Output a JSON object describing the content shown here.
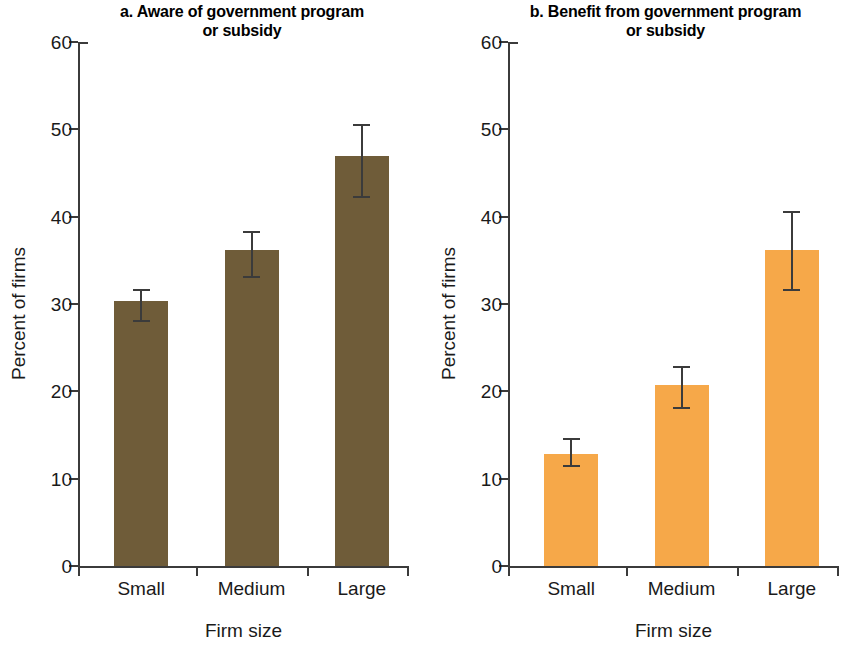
{
  "chart_data": [
    {
      "type": "bar",
      "panel_letter": "a.",
      "title": "a. Aware of government program or subsidy",
      "title_line1": "a. Aware of government program",
      "title_line2": "or subsidy",
      "categories": [
        "Small",
        "Medium",
        "Large"
      ],
      "values": [
        30.3,
        36.2,
        47.0
      ],
      "errors_low": [
        28.0,
        33.1,
        42.2
      ],
      "errors_high": [
        31.6,
        38.3,
        50.5
      ],
      "xlabel": "Firm size",
      "ylabel": "Percent of firms",
      "ylim": [
        0,
        60
      ],
      "yticks": [
        0,
        10,
        20,
        30,
        40,
        50,
        60
      ],
      "ytick_labels": [
        "0",
        "10",
        "20",
        "30",
        "40",
        "50",
        "60"
      ],
      "grid": false,
      "legend": "none",
      "bar_color": "#6f5c39"
    },
    {
      "type": "bar",
      "panel_letter": "b.",
      "title": "b. Benefit from government program or subsidy",
      "title_line1": "b. Benefit from government program",
      "title_line2": "or subsidy",
      "categories": [
        "Small",
        "Medium",
        "Large"
      ],
      "values": [
        12.8,
        20.7,
        36.2
      ],
      "errors_low": [
        11.4,
        18.1,
        31.6
      ],
      "errors_high": [
        14.5,
        22.8,
        40.5
      ],
      "xlabel": "Firm size",
      "ylabel": "Percent of firms",
      "ylim": [
        0,
        60
      ],
      "yticks": [
        0,
        10,
        20,
        30,
        40,
        50,
        60
      ],
      "ytick_labels": [
        "0",
        "10",
        "20",
        "30",
        "40",
        "50",
        "60"
      ],
      "grid": false,
      "legend": "none",
      "bar_color": "#f6a849"
    }
  ]
}
